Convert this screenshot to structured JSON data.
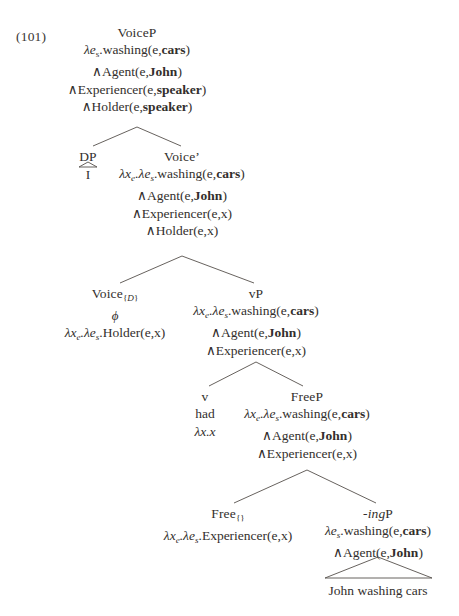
{
  "figure": {
    "example_number": "(101)",
    "caption_text": "John washing cars"
  },
  "symbols": {
    "lambda": "λ",
    "and": "∧",
    "phi": "ϕ"
  },
  "tree": {
    "type": "syntax-tree",
    "root": "VoiceP",
    "nodes": [
      {
        "id": "voiceP",
        "label": "VoiceP",
        "x": 137,
        "y": 24,
        "denotation_lines": [
          "λeₛ.washing(e,cars)",
          "∧Agent(e,John)",
          "∧Experiencer(e,speaker)",
          "∧Holder(e,speaker)"
        ]
      },
      {
        "id": "dp",
        "label": "DP",
        "x": 88,
        "y": 148,
        "terminal": "I",
        "has_triangle": true,
        "denotation_lines": []
      },
      {
        "id": "voicebar",
        "label": "Voice’",
        "x": 182,
        "y": 148,
        "denotation_lines": [
          "λxₑ.λeₛ.washing(e,cars)",
          "∧Agent(e,John)",
          "∧Experiencer(e,x)",
          "∧Holder(e,x)"
        ]
      },
      {
        "id": "voiceD",
        "label": "Voice{D}",
        "x": 115,
        "y": 285,
        "exponent": "ϕ",
        "denotation_lines": [
          "λxₑ.λeₛ.Holder(e,x)"
        ]
      },
      {
        "id": "vP",
        "label": "vP",
        "x": 256,
        "y": 285,
        "denotation_lines": [
          "λxₑ.λeₛ.washing(e,cars)",
          "∧Agent(e,John)",
          "∧Experiencer(e,x)"
        ]
      },
      {
        "id": "v",
        "label": "v",
        "x": 205,
        "y": 388,
        "exponent": "had",
        "denotation_lines": [
          "λx.x"
        ]
      },
      {
        "id": "freeP",
        "label": "FreeP",
        "x": 307,
        "y": 388,
        "denotation_lines": [
          "λxₑ.λeₛ.washing(e,cars)",
          "∧Agent(e,John)",
          "∧Experiencer(e,x)"
        ]
      },
      {
        "id": "free",
        "label": "Free{}",
        "x": 228,
        "y": 505,
        "denotation_lines": [
          "λxₑ.λeₛ.Experiencer(e,x)"
        ]
      },
      {
        "id": "ingP",
        "label": "-ingP",
        "x": 378,
        "y": 505,
        "has_triangle": true,
        "terminal": "John washing cars",
        "denotation_lines": [
          "λeₛ.washing(e,cars)",
          "∧Agent(e,John)"
        ]
      }
    ],
    "edges": [
      {
        "from": "voiceP",
        "to": "dp"
      },
      {
        "from": "voiceP",
        "to": "voicebar"
      },
      {
        "from": "voicebar",
        "to": "voiceD"
      },
      {
        "from": "voicebar",
        "to": "vP"
      },
      {
        "from": "vP",
        "to": "v"
      },
      {
        "from": "vP",
        "to": "freeP"
      },
      {
        "from": "freeP",
        "to": "free"
      },
      {
        "from": "freeP",
        "to": "ingP"
      }
    ]
  },
  "text": {
    "voiceP_label": "VoiceP",
    "voiceP_l1_pre": "λe",
    "voiceP_l1_sub": "s",
    "voiceP_l1_mid": ".washing(e,",
    "voiceP_l1_bold": "cars",
    "voiceP_l1_post": ")",
    "voiceP_l2_pre": "∧Agent(e,",
    "voiceP_l2_bold": "John",
    "voiceP_l2_post": ")",
    "voiceP_l3_pre": "∧Experiencer(e,",
    "voiceP_l3_bold": "speaker",
    "voiceP_l3_post": ")",
    "voiceP_l4_pre": "∧Holder(e,",
    "voiceP_l4_bold": "speaker",
    "voiceP_l4_post": ")",
    "dp_label": "DP",
    "dp_terminal": "I",
    "voicebar_label": "Voice’",
    "voicebar_l1_pre": "λx",
    "voicebar_l1_sub1": "e",
    "voicebar_l1_mid1": ".λe",
    "voicebar_l1_sub2": "s",
    "voicebar_l1_mid2": ".washing(e,",
    "voicebar_l1_bold": "cars",
    "voicebar_l1_post": ")",
    "voicebar_l2_pre": "∧Agent(e,",
    "voicebar_l2_bold": "John",
    "voicebar_l2_post": ")",
    "voicebar_l3": "∧Experiencer(e,x)",
    "voicebar_l4": "∧Holder(e,x)",
    "voiceD_label_pre": "Voice",
    "voiceD_label_sub_open": "{",
    "voiceD_label_sub_it": "D",
    "voiceD_label_sub_close": "}",
    "voiceD_exponent": "ϕ",
    "voiceD_l1_pre": "λx",
    "voiceD_l1_sub1": "e",
    "voiceD_l1_mid1": ".λe",
    "voiceD_l1_sub2": "s",
    "voiceD_l1_post": ".Holder(e,x)",
    "vP_label": "vP",
    "vP_l1_pre": "λx",
    "vP_l1_sub1": "e",
    "vP_l1_mid1": ".λe",
    "vP_l1_sub2": "s",
    "vP_l1_mid2": ".washing(e,",
    "vP_l1_bold": "cars",
    "vP_l1_post": ")",
    "vP_l2_pre": "∧Agent(e,",
    "vP_l2_bold": "John",
    "vP_l2_post": ")",
    "vP_l3": "∧Experiencer(e,x)",
    "v_label": "v",
    "v_exponent": "had",
    "v_denotation": "λx.x",
    "freeP_label": "FreeP",
    "freeP_l1_pre": "λx",
    "freeP_l1_sub1": "e",
    "freeP_l1_mid1": ".λe",
    "freeP_l1_sub2": "s",
    "freeP_l1_mid2": ".washing(e,",
    "freeP_l1_bold": "cars",
    "freeP_l1_post": ")",
    "freeP_l2_pre": "∧Agent(e,",
    "freeP_l2_bold": "John",
    "freeP_l2_post": ")",
    "freeP_l3": "∧Experiencer(e,x)",
    "free_label_pre": "Free",
    "free_label_sub": "{}",
    "free_l1_pre": "λx",
    "free_l1_sub1": "e",
    "free_l1_mid1": ".λe",
    "free_l1_sub2": "s",
    "free_l1_post": ".Experiencer(e,x)",
    "ingP_label_it": "-ing",
    "ingP_label_post": "P",
    "ingP_l1_pre": "λe",
    "ingP_l1_sub": "s",
    "ingP_l1_mid": ".washing(e,",
    "ingP_l1_bold": "cars",
    "ingP_l1_post": ")",
    "ingP_l2_pre": "∧Agent(e,",
    "ingP_l2_bold": "John",
    "ingP_l2_post": ")",
    "ingP_terminal": "John washing cars"
  }
}
